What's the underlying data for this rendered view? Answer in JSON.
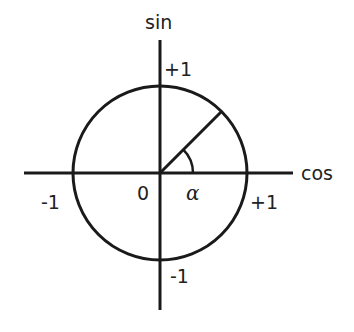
{
  "diagram": {
    "type": "unit-circle",
    "stroke_color": "#1a1a1a",
    "background": "#ffffff",
    "center": {
      "x": 160,
      "y": 173
    },
    "radius": 87,
    "x_axis": {
      "label": "cos",
      "from": 24,
      "to": 293
    },
    "y_axis": {
      "label": "sin",
      "from": 40,
      "to": 310
    },
    "origin_label": "0",
    "angle_label": "α",
    "angle_degrees": 45,
    "tick_labels": {
      "x_pos": "+1",
      "x_neg": "-1",
      "y_pos": "+1",
      "y_neg": "-1"
    }
  }
}
